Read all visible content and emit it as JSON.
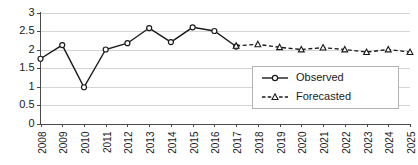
{
  "chart_data": {
    "type": "line",
    "title": "",
    "xlabel": "",
    "ylabel": "",
    "x": [
      2008,
      2009,
      2010,
      2011,
      2012,
      2013,
      2014,
      2015,
      2016,
      2017,
      2018,
      2019,
      2020,
      2021,
      2022,
      2023,
      2024,
      2025
    ],
    "xtick_labels": [
      "2008",
      "2009",
      "2010",
      "2011",
      "2012",
      "2013",
      "2014",
      "2015",
      "2016",
      "2017",
      "2018",
      "2019",
      "2020",
      "2021",
      "2022",
      "2023",
      "2024",
      "2025"
    ],
    "ytick_labels": [
      "0",
      "0.5",
      "1",
      "1.5",
      "2",
      "2.5",
      "3"
    ],
    "ytick_values": [
      0,
      0.5,
      1,
      1.5,
      2,
      2.5,
      3
    ],
    "ylim": [
      0,
      3
    ],
    "xlim": [
      2008,
      2025
    ],
    "grid": "horizontal",
    "legend_position": "center-right",
    "series": [
      {
        "name": "Observed",
        "marker": "circle-open",
        "linestyle": "solid",
        "color": "#1a1a1a",
        "x": [
          2008,
          2009,
          2010,
          2011,
          2012,
          2013,
          2014,
          2015,
          2016,
          2017
        ],
        "values": [
          1.75,
          2.12,
          0.98,
          2.0,
          2.17,
          2.58,
          2.2,
          2.6,
          2.5,
          2.08
        ]
      },
      {
        "name": "Forecasted",
        "marker": "triangle-open",
        "linestyle": "dashed",
        "color": "#1a1a1a",
        "x": [
          2017,
          2018,
          2019,
          2020,
          2021,
          2022,
          2023,
          2024,
          2025
        ],
        "values": [
          2.1,
          2.14,
          2.06,
          2.0,
          2.05,
          2.0,
          1.93,
          2.0,
          1.93
        ]
      }
    ]
  },
  "legend": {
    "entries": [
      {
        "label": "Observed"
      },
      {
        "label": "Forecasted"
      }
    ]
  }
}
